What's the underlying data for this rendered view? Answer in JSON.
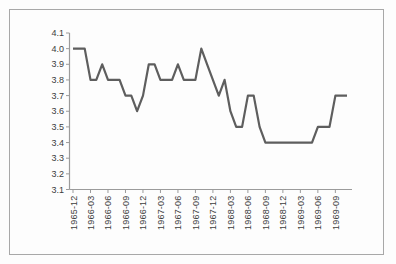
{
  "figure": {
    "border_color": "#a8a8a8",
    "background": "#fdfdfd"
  },
  "chart_data": {
    "type": "line",
    "title": "",
    "xlabel": "",
    "ylabel": "",
    "legend": "none",
    "grid": false,
    "x": [
      "1965-12",
      "1966-01",
      "1966-02",
      "1966-03",
      "1966-04",
      "1966-05",
      "1966-06",
      "1966-07",
      "1966-08",
      "1966-09",
      "1966-10",
      "1966-11",
      "1966-12",
      "1967-01",
      "1967-02",
      "1967-03",
      "1967-04",
      "1967-05",
      "1967-06",
      "1967-07",
      "1967-08",
      "1967-09",
      "1967-10",
      "1967-11",
      "1967-12",
      "1968-01",
      "1968-02",
      "1968-03",
      "1968-04",
      "1968-05",
      "1968-06",
      "1968-07",
      "1968-08",
      "1968-09",
      "1968-10",
      "1968-11",
      "1968-12",
      "1969-01",
      "1969-02",
      "1969-03",
      "1969-04",
      "1969-05",
      "1969-06",
      "1969-07",
      "1969-08",
      "1969-09",
      "1969-10",
      "1969-11"
    ],
    "values": [
      4.0,
      4.0,
      4.0,
      3.8,
      3.8,
      3.9,
      3.8,
      3.8,
      3.8,
      3.7,
      3.7,
      3.6,
      3.7,
      3.9,
      3.9,
      3.8,
      3.8,
      3.8,
      3.9,
      3.8,
      3.8,
      3.8,
      4.0,
      3.9,
      3.8,
      3.7,
      3.8,
      3.6,
      3.5,
      3.5,
      3.7,
      3.7,
      3.5,
      3.4,
      3.4,
      3.4,
      3.4,
      3.4,
      3.4,
      3.4,
      3.4,
      3.4,
      3.5,
      3.5,
      3.5,
      3.7,
      3.7,
      3.7
    ],
    "x_tick_labels": [
      "1965-12",
      "1966-03",
      "1966-06",
      "1966-09",
      "1966-12",
      "1967-03",
      "1967-06",
      "1967-09",
      "1967-12",
      "1968-03",
      "1968-06",
      "1968-09",
      "1968-12",
      "1969-03",
      "1969-06",
      "1969-09"
    ],
    "x_tick_step": 3,
    "y_tick_labels": [
      "4.1",
      "4.0",
      "3.9",
      "3.8",
      "3.7",
      "3.6",
      "3.5",
      "3.4",
      "3.3",
      "3.2",
      "3.1"
    ],
    "ylim": [
      3.1,
      4.1
    ],
    "line_color": "#5e5e5e",
    "axis_color": "#9b9b9b",
    "tick_label_color": "#3c3c3c"
  }
}
